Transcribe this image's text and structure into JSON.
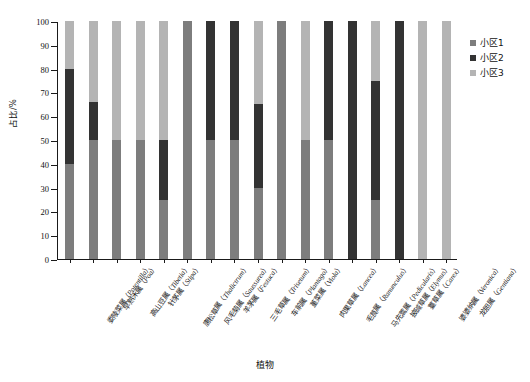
{
  "chart_data": {
    "type": "bar",
    "subtype": "stacked-100-percent",
    "title": "",
    "xlabel": "植物",
    "ylabel": "占比/%",
    "ylim": [
      0,
      100
    ],
    "ytick_values": [
      0,
      10,
      20,
      30,
      40,
      50,
      60,
      70,
      80,
      90,
      100
    ],
    "ytick_labels": [
      "0",
      "10",
      "20",
      "30",
      "40",
      "50",
      "60",
      "70",
      "80",
      "90",
      "100"
    ],
    "grid": false,
    "legend_position": "right",
    "categories": [
      "委陵菜属（Potentilla）",
      "早熟禾属（Poa）",
      "高山豆属（Tibetia）",
      "针茅属（Stipa）",
      "唐松草属（Thalictrum）",
      "风毛菊属（Saussurea）",
      "羊茅属（Festuca）",
      "三毛草属（Trisetum）",
      "车前属（Plantago）",
      "堇菜属（Viola）",
      "肉果草属（Lancea）",
      "毛茛属（Ranunculus）",
      "马先蒿属（Pedicularis）",
      "披碱草属（Elymus）",
      "薹草属（Carex）",
      "婆婆纳属（Veronica）",
      "龙胆属（Gentiana）"
    ],
    "categories_cn": [
      "委陵菜属",
      "早熟禾属",
      "高山豆属",
      "针茅属",
      "唐松草属",
      "风毛菊属",
      "羊茅属",
      "三毛草属",
      "车前属",
      "堇菜属",
      "肉果草属",
      "毛茛属",
      "马先蒿属",
      "披碱草属",
      "薹草属",
      "婆婆纳属",
      "龙胆属"
    ],
    "categories_sci": [
      "Potentilla",
      "Poa",
      "Tibetia",
      "Stipa",
      "Thalictrum",
      "Saussurea",
      "Festuca",
      "Trisetum",
      "Plantago",
      "Viola",
      "Lancea",
      "Ranunculus",
      "Pedicularis",
      "Elymus",
      "Carex",
      "Veronica",
      "Gentiana"
    ],
    "series": [
      {
        "name": "小区1",
        "color": "#7d7d7d",
        "values": [
          40,
          50,
          50,
          50,
          25,
          100,
          50,
          50,
          30,
          100,
          50,
          50,
          0,
          25,
          0,
          0,
          0
        ]
      },
      {
        "name": "小区2",
        "color": "#333333",
        "values": [
          40,
          16,
          0,
          0,
          25,
          0,
          50,
          50,
          35,
          0,
          0,
          50,
          100,
          50,
          100,
          0,
          0
        ]
      },
      {
        "name": "小区3",
        "color": "#b4b4b4",
        "values": [
          20,
          34,
          50,
          50,
          50,
          0,
          0,
          0,
          35,
          0,
          50,
          0,
          0,
          25,
          0,
          100,
          100
        ]
      }
    ]
  },
  "legend": {
    "items": [
      {
        "label": "小区1",
        "color": "#7d7d7d"
      },
      {
        "label": "小区2",
        "color": "#333333"
      },
      {
        "label": "小区3",
        "color": "#b4b4b4"
      }
    ]
  },
  "axes": {
    "y_title": "占比/%",
    "x_title": "植物"
  }
}
